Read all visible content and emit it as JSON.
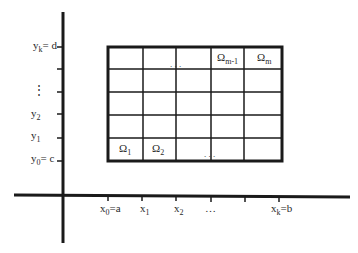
{
  "diagram": {
    "type": "domain-partition-grid",
    "axes": {
      "x_ticks": [
        {
          "sym": "x",
          "sub": "0",
          "suffix": "=a"
        },
        {
          "sym": "x",
          "sub": "1",
          "suffix": ""
        },
        {
          "sym": "x",
          "sub": "2",
          "suffix": ""
        },
        {
          "sym": "…",
          "sub": "",
          "suffix": ""
        },
        {
          "sym": "",
          "sub": "",
          "suffix": ""
        },
        {
          "sym": "x",
          "sub": "k",
          "suffix": "=b"
        }
      ],
      "y_ticks": [
        {
          "sym": "y",
          "sub": "0",
          "suffix": "= c"
        },
        {
          "sym": "y",
          "sub": "1",
          "suffix": ""
        },
        {
          "sym": "y",
          "sub": "2",
          "suffix": ""
        },
        {
          "sym": "⋮",
          "sub": "",
          "suffix": ""
        },
        {
          "sym": "",
          "sub": "",
          "suffix": ""
        },
        {
          "sym": "y",
          "sub": "k",
          "suffix": "= d"
        }
      ]
    },
    "cells": {
      "omega_1": {
        "sym": "Ω",
        "sub": "1"
      },
      "omega_2": {
        "sym": "Ω",
        "sub": "2"
      },
      "omega_m_minus_1": {
        "sym": "Ω",
        "sub": "m-1"
      },
      "omega_m": {
        "sym": "Ω",
        "sub": "m"
      },
      "top_ellipsis": ". . .",
      "bottom_ellipsis": ". . ."
    },
    "colors": {
      "line": "#1a1a1a",
      "text": "#2a2a2a",
      "background": "#ffffff"
    }
  }
}
